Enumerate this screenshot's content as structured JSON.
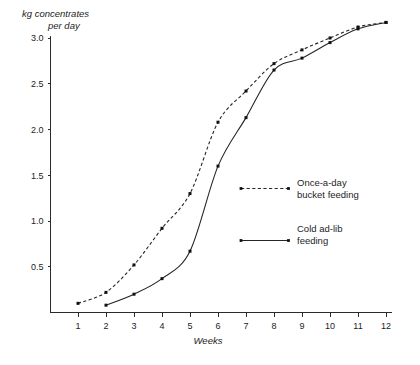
{
  "chart_data": {
    "type": "line",
    "title": "kg concentrates per day",
    "title_line1": "kg concentrates",
    "title_line2": "per day",
    "xlabel": "Weeks",
    "ylabel": "kg concentrates per day",
    "x": [
      1,
      2,
      3,
      4,
      5,
      6,
      7,
      8,
      9,
      10,
      11,
      12
    ],
    "xlim": [
      0.6,
      12.4
    ],
    "ylim": [
      0,
      3.3
    ],
    "ytick_labels": [
      "0.5",
      "1.0",
      "1.5",
      "2.0",
      "2.5",
      "3.0"
    ],
    "ytick_values": [
      0.5,
      1.0,
      1.5,
      2.0,
      2.5,
      3.0
    ],
    "xtick_labels": [
      "1",
      "2",
      "3",
      "4",
      "5",
      "6",
      "7",
      "8",
      "9",
      "10",
      "11",
      "12"
    ],
    "grid": false,
    "legend_position": "center-right",
    "series": [
      {
        "name": "Once-a-day bucket feeding",
        "legend_line1": "Once-a-day",
        "legend_line2": "bucket feeding",
        "style": "dashed",
        "color": "#262626",
        "x": [
          1,
          2,
          3,
          4,
          5,
          6,
          7,
          8,
          9,
          10,
          11,
          12
        ],
        "values": [
          0.1,
          0.22,
          0.52,
          0.92,
          1.3,
          2.08,
          2.42,
          2.72,
          2.87,
          3.0,
          3.12,
          3.17
        ]
      },
      {
        "name": "Cold ad-lib feeding",
        "legend_line1": "Cold ad-lib",
        "legend_line2": "feeding",
        "style": "solid",
        "color": "#262626",
        "x": [
          2,
          3,
          4,
          5,
          6,
          7,
          8,
          9,
          10,
          11,
          12
        ],
        "values": [
          0.08,
          0.2,
          0.37,
          0.67,
          1.6,
          2.13,
          2.65,
          2.78,
          2.95,
          3.1,
          3.17
        ]
      }
    ]
  }
}
